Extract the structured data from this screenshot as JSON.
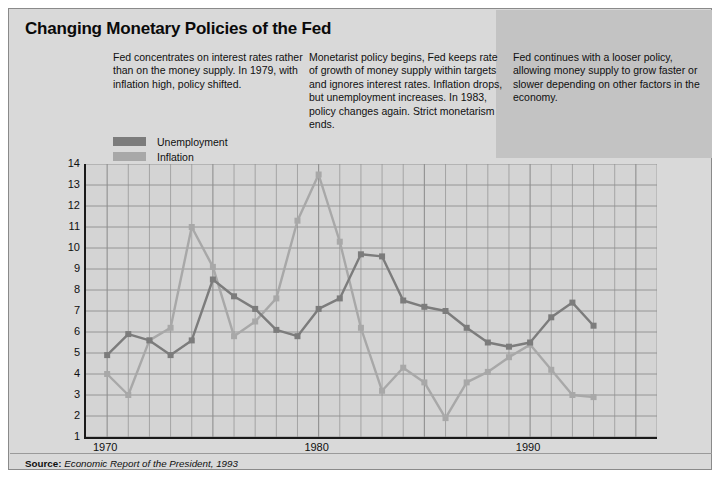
{
  "figure": {
    "title": "Changing Monetary Policies of the Fed",
    "source_prefix": "Source:",
    "source_text": "Economic Report of the President, 1993",
    "notes": [
      "Fed concentrates on interest rates rather than on the money supply. In 1979, with inflation high, policy shifted.",
      "Monetarist policy begins, Fed keeps rate of growth of money supply within targets and ignores interest rates. Inflation drops, but unemployment increases. In 1983, policy changes again. Strict monetarism ends.",
      "Fed continues with a looser policy, allowing money supply to grow faster or slower depending on other factors in the economy."
    ],
    "colors": {
      "background": "#d9d9d9",
      "band": "#c3c3c3",
      "plot_background": "#d4d4d4",
      "unemployment": "#7c7c7c",
      "inflation": "#a8a8a8",
      "grid": "#8f8f8f",
      "axis": "#1a1a1a"
    }
  },
  "chart_data": {
    "type": "line",
    "title": "Changing Monetary Policies of the Fed",
    "xlabel": "",
    "ylabel": "% Unemployment 1970-1993 a monetary rule",
    "xlim": [
      1969,
      1996
    ],
    "ylim": [
      1,
      14
    ],
    "yticks": [
      14,
      13,
      12,
      11,
      10,
      9,
      8,
      7,
      6,
      5,
      4,
      3,
      2,
      1
    ],
    "xticks": [
      1970,
      1980,
      1990
    ],
    "x": [
      1970,
      1971,
      1972,
      1973,
      1974,
      1975,
      1976,
      1977,
      1978,
      1979,
      1980,
      1981,
      1982,
      1983,
      1984,
      1985,
      1986,
      1987,
      1988,
      1989,
      1990,
      1991,
      1992,
      1993
    ],
    "grid": true,
    "legend_position": "top-left",
    "series": [
      {
        "name": "Unemployment",
        "color": "#7c7c7c",
        "values": [
          4.9,
          5.9,
          5.6,
          4.9,
          5.6,
          8.5,
          7.7,
          7.1,
          6.1,
          5.8,
          7.1,
          7.6,
          9.7,
          9.6,
          7.5,
          7.2,
          7.0,
          6.2,
          5.5,
          5.3,
          5.5,
          6.7,
          7.4,
          6.3
        ]
      },
      {
        "name": "Inflation",
        "color": "#a8a8a8",
        "values": [
          4.0,
          3.0,
          5.6,
          6.2,
          11.0,
          9.1,
          5.8,
          6.5,
          7.6,
          11.3,
          13.5,
          10.3,
          6.2,
          3.2,
          4.3,
          3.6,
          1.9,
          3.6,
          4.1,
          4.8,
          5.4,
          4.2,
          3.0,
          2.9
        ]
      }
    ]
  },
  "legend": {
    "items": [
      {
        "label": "Unemployment",
        "color": "#7c7c7c"
      },
      {
        "label": "Inflation",
        "color": "#a8a8a8"
      }
    ]
  }
}
